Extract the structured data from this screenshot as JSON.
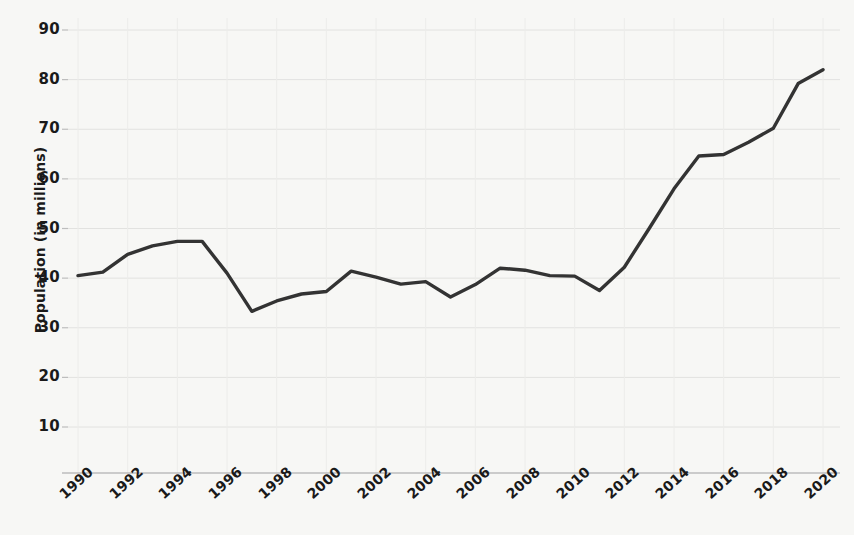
{
  "chart_data": {
    "type": "line",
    "title": "",
    "xlabel": "",
    "ylabel": "Population (in millions)",
    "xlim": [
      1990,
      2020
    ],
    "ylim": [
      0,
      93
    ],
    "grid": true,
    "legend": "none",
    "line_color": "#333333",
    "background_color": "#f7f7f5",
    "grid_color": "#e2e2e0",
    "axis_color": "#bdbdbd",
    "ytick_labels": [
      "10",
      "20",
      "30",
      "40",
      "50",
      "60",
      "70",
      "80",
      "90"
    ],
    "ytick_values": [
      10,
      20,
      30,
      40,
      50,
      60,
      70,
      80,
      90
    ],
    "xtick_labels": [
      "1990",
      "1992",
      "1994",
      "1996",
      "1998",
      "2000",
      "2002",
      "2004",
      "2006",
      "2008",
      "2010",
      "2012",
      "2014",
      "2016",
      "2018",
      "2020"
    ],
    "xtick_values": [
      1990,
      1992,
      1994,
      1996,
      1998,
      2000,
      2002,
      2004,
      2006,
      2008,
      2010,
      2012,
      2014,
      2016,
      2018,
      2020
    ],
    "x": [
      1990,
      1991,
      1992,
      1993,
      1994,
      1995,
      1996,
      1997,
      1998,
      1999,
      2000,
      2001,
      2002,
      2003,
      2004,
      2005,
      2006,
      2007,
      2008,
      2009,
      2010,
      2011,
      2012,
      2013,
      2014,
      2015,
      2016,
      2017,
      2018,
      2019,
      2020
    ],
    "values": [
      40.5,
      41.2,
      44.8,
      46.5,
      47.4,
      47.4,
      41.0,
      33.3,
      35.4,
      36.8,
      37.3,
      41.4,
      40.2,
      38.8,
      39.3,
      36.2,
      38.7,
      42.0,
      41.6,
      40.5,
      40.4,
      37.5,
      42.2,
      50.0,
      58.0,
      64.6,
      64.9,
      67.4,
      70.2,
      79.2,
      82.0
    ],
    "series_name": "Population"
  }
}
